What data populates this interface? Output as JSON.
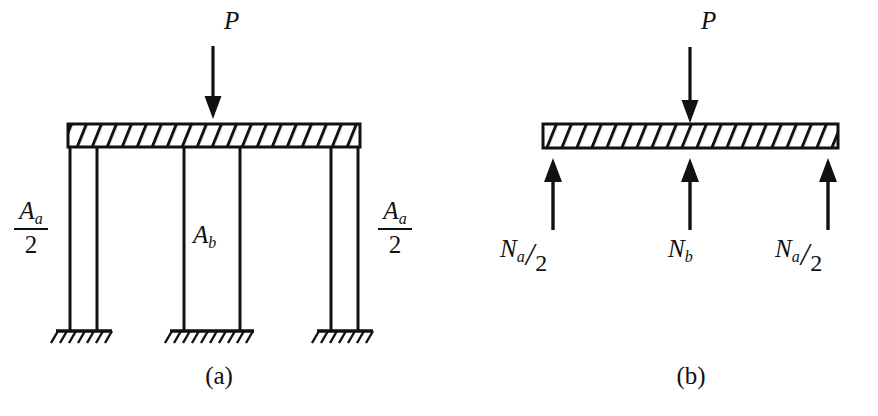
{
  "figure": {
    "type": "engineering-structural-diagram",
    "background_color": "#ffffff",
    "line_color": "#111111",
    "hatch_color": "#111111",
    "width": 878,
    "height": 416
  },
  "panel_a": {
    "caption": "(a)",
    "description": "Rigid beam on three columns with fixed (hatched ground) supports",
    "applied_load": {
      "label": "P",
      "direction": "down"
    },
    "members": [
      {
        "name": "left-column",
        "label_numerator": "A",
        "label_subscript": "a",
        "label_denominator": "2"
      },
      {
        "name": "middle-column",
        "label_main": "A",
        "label_subscript": "b"
      },
      {
        "name": "right-column",
        "label_numerator": "A",
        "label_subscript": "a",
        "label_denominator": "2"
      }
    ],
    "left_label": {
      "numerator_var": "A",
      "numerator_sub": "a",
      "denominator": "2"
    },
    "middle_label": {
      "var": "A",
      "sub": "b"
    },
    "right_label": {
      "numerator_var": "A",
      "numerator_sub": "a",
      "denominator": "2"
    },
    "beam": {
      "fill": "hatched",
      "hatch_count": 18
    },
    "supports": [
      "fixed-ground-left",
      "fixed-ground-middle",
      "fixed-ground-right"
    ]
  },
  "panel_b": {
    "caption": "(b)",
    "description": "Free-body diagram of the beam with reaction forces",
    "applied_load": {
      "label": "P",
      "direction": "down"
    },
    "reactions": [
      {
        "name": "left-reaction",
        "var": "N",
        "sub": "a",
        "slash": "/",
        "den": "2",
        "direction": "up"
      },
      {
        "name": "middle-reaction",
        "var": "N",
        "sub": "b",
        "direction": "up"
      },
      {
        "name": "right-reaction",
        "var": "N",
        "sub": "a",
        "slash": "/",
        "den": "2",
        "direction": "up"
      }
    ],
    "beam": {
      "fill": "hatched",
      "hatch_count": 18
    }
  }
}
